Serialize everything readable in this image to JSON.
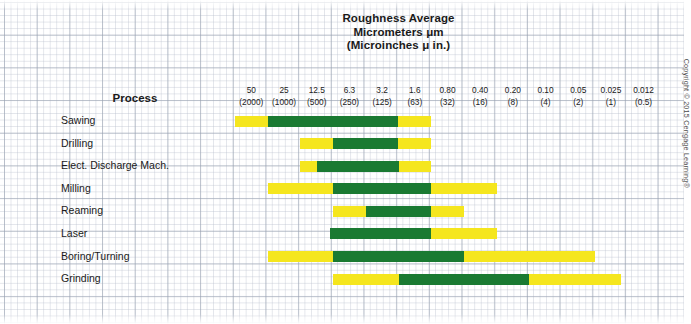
{
  "title": {
    "line1": "Roughness Average",
    "line2": "Micrometers μm",
    "line3": "(Microinches μ in.)"
  },
  "process_header": "Process",
  "copyright": "Copyright © 2015 Cengage Learning®",
  "colors": {
    "typical_range": "#1a7a32",
    "less_frequent": "#f5e61e",
    "grid": "#96a0af",
    "text": "#1a1a1a"
  },
  "chart_data": {
    "type": "bar",
    "title": "Roughness Average Micrometers μm (Microinches μ in.)",
    "xlabel": "Roughness Average",
    "ylabel": "Process",
    "grid": true,
    "legend": "none",
    "categories": [
      "Sawing",
      "Drilling",
      "Elect. Discharge Mach.",
      "Milling",
      "Reaming",
      "Laser",
      "Boring/Turning",
      "Grinding"
    ],
    "columns": [
      {
        "micrometers": "50",
        "microinches": "(2000)"
      },
      {
        "micrometers": "25",
        "microinches": "(1000)"
      },
      {
        "micrometers": "12.5",
        "microinches": "(500)"
      },
      {
        "micrometers": "6.3",
        "microinches": "(250)"
      },
      {
        "micrometers": "3.2",
        "microinches": "(125)"
      },
      {
        "micrometers": "1.6",
        "microinches": "(63)"
      },
      {
        "micrometers": "0.80",
        "microinches": "(32)"
      },
      {
        "micrometers": "0.40",
        "microinches": "(16)"
      },
      {
        "micrometers": "0.20",
        "microinches": "(8)"
      },
      {
        "micrometers": "0.10",
        "microinches": "(4)"
      },
      {
        "micrometers": "0.05",
        "microinches": "(2)"
      },
      {
        "micrometers": "0.025",
        "microinches": "(1)"
      },
      {
        "micrometers": "0.012",
        "microinches": "(0.5)"
      }
    ],
    "series": [
      {
        "name": "Less frequent application",
        "color": "#f5e61e"
      },
      {
        "name": "Average application (typical range)",
        "color": "#1a7a32"
      }
    ],
    "rows": [
      {
        "process": "Sawing",
        "yellow": {
          "start_col": 0,
          "end_col": 6
        },
        "green": {
          "start_col": 1,
          "end_col": 5
        },
        "yellow_range_um": "50 to 0.80",
        "green_range_um": "25 to 1.6"
      },
      {
        "process": "Drilling",
        "yellow": {
          "start_col": 2,
          "end_col": 6
        },
        "green": {
          "start_col": 3,
          "end_col": 5
        },
        "yellow_range_um": "12.5 to 0.80",
        "green_range_um": "6.3 to 1.6"
      },
      {
        "process": "Elect. Discharge Mach.",
        "yellow": {
          "start_col": 2,
          "end_col": 6
        },
        "green": {
          "start_col": 2.5,
          "end_col": 5
        },
        "yellow_range_um": "12.5 to 0.80",
        "green_range_um": "9 to 1.6"
      },
      {
        "process": "Milling",
        "yellow": {
          "start_col": 1,
          "end_col": 8
        },
        "green": {
          "start_col": 3,
          "end_col": 6
        },
        "yellow_range_um": "25 to 0.20",
        "green_range_um": "6.3 to 0.80"
      },
      {
        "process": "Reaming",
        "yellow": {
          "start_col": 3,
          "end_col": 7
        },
        "green": {
          "start_col": 4,
          "end_col": 6
        },
        "yellow_range_um": "6.3 to 0.40",
        "green_range_um": "3.2 to 0.80"
      },
      {
        "process": "Laser",
        "yellow": {
          "start_col": 6,
          "end_col": 8
        },
        "green": {
          "start_col": 2.9,
          "end_col": 6
        },
        "yellow_range_um": "0.80 to 0.20",
        "green_range_um": "8 to 0.80"
      },
      {
        "process": "Boring/Turning",
        "yellow": {
          "start_col": 1,
          "end_col": 11
        },
        "green": {
          "start_col": 3,
          "end_col": 7
        },
        "yellow_range_um": "25 to 0.025",
        "green_range_um": "6.3 to 0.40"
      },
      {
        "process": "Grinding",
        "yellow": {
          "start_col": 3,
          "end_col": 11.8
        },
        "green": {
          "start_col": 5,
          "end_col": 9
        },
        "yellow_range_um": "6.3 to 0.012",
        "green_range_um": "1.6 to 0.10"
      }
    ]
  }
}
